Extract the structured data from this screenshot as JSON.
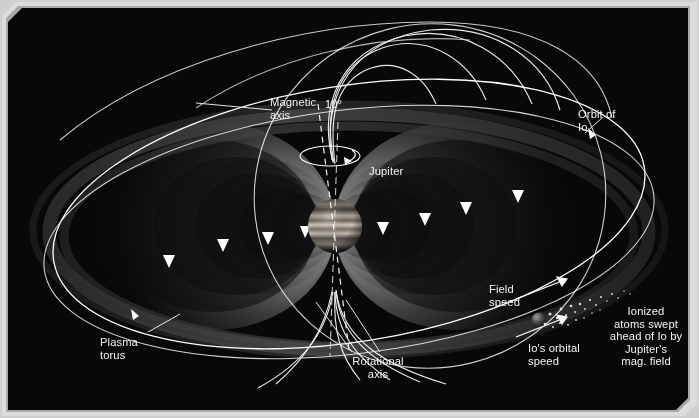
{
  "figure": {
    "background_color": "#000000",
    "frame_color": "#d8d8d8",
    "label_color": "#f4f4f4"
  },
  "labels": {
    "magnetic_axis": "Magnetic\naxis",
    "tilt_angle": "10°",
    "jupiter": "Jupiter",
    "orbit_of_io": "Orbit of\nIo",
    "field_speed": "Field\nspeed",
    "io_orbital_speed": "Io's orbital\nspeed",
    "ionized_atoms": "Ionized\natoms swept\nahead of Io by\nJupiter's\nmag. field",
    "plasma_torus": "Plasma\ntorus",
    "rotational_axis": "Rotational\naxis"
  },
  "objects": {
    "planet": {
      "name": "Jupiter",
      "cx": 335,
      "cy": 226,
      "r": 27,
      "band_colors": [
        "#8d857c",
        "#cfc7bb",
        "#5d564e",
        "#b8b0a4"
      ]
    },
    "moon": {
      "name": "Io",
      "cx": 539,
      "cy": 320,
      "r": 7,
      "color": "#4a4a4a"
    },
    "ion_cloud": {
      "name": "ionized atom stream",
      "from": [
        546,
        316
      ],
      "to": [
        640,
        285
      ]
    },
    "magnetic_axis_tilt_degrees": 10,
    "field_line_color": "#ffffff",
    "lobe_color": "#6e6e6e",
    "torus_color": "#3a3a3a"
  }
}
